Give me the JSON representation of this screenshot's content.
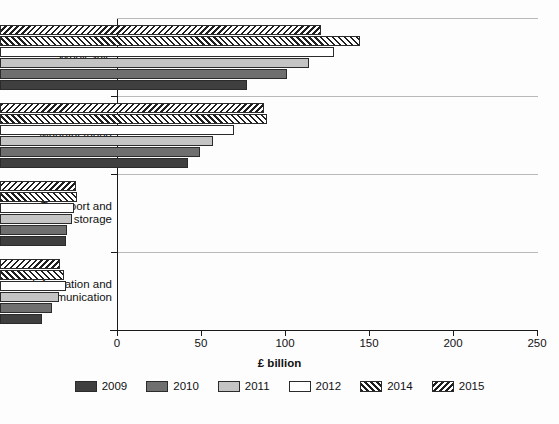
{
  "chart_data": {
    "type": "bar",
    "orientation": "horizontal",
    "title": "",
    "xlabel": "£ billion",
    "ylabel": "",
    "xlim": [
      0,
      250
    ],
    "grid": false,
    "legend_position": "bottom",
    "categories": [
      "Wholesale",
      "Manufacturing",
      "Transport and storage",
      "Information and communication"
    ],
    "xticks": [
      "0",
      "50",
      "100",
      "150",
      "200",
      "250"
    ],
    "xtick_values": [
      0,
      50,
      100,
      150,
      200,
      250
    ],
    "series": [
      {
        "name": "2009",
        "color": "#3f3f3f",
        "pattern": "solid",
        "values": [
          147,
          112,
          39,
          25
        ]
      },
      {
        "name": "2010",
        "color": "#6f6f6f",
        "pattern": "solid",
        "values": [
          171,
          119,
          40,
          31
        ]
      },
      {
        "name": "2011",
        "color": "#c4c4c4",
        "pattern": "solid",
        "values": [
          184,
          127,
          43,
          35
        ]
      },
      {
        "name": "2012",
        "color": "#ffffff",
        "pattern": "solid",
        "values": [
          199,
          139,
          44,
          39
        ]
      },
      {
        "name": "2014",
        "color": "#ffffff",
        "pattern": "hatch-foward",
        "values": [
          214,
          159,
          46,
          38
        ]
      },
      {
        "name": "2015",
        "color": "#ffffff",
        "pattern": "hatch-back",
        "values": [
          191,
          157,
          45,
          36
        ]
      }
    ]
  },
  "legend": {
    "items": [
      {
        "label": "2009",
        "swatch": "swatch-2009"
      },
      {
        "label": "2010",
        "swatch": "swatch-2010"
      },
      {
        "label": "2011",
        "swatch": "swatch-2011"
      },
      {
        "label": "2012",
        "swatch": "swatch-2012"
      },
      {
        "label": "2014",
        "swatch": "swatch-2014"
      },
      {
        "label": "2015",
        "swatch": "swatch-2015"
      }
    ]
  },
  "axis": {
    "x_title": "£ billion"
  }
}
